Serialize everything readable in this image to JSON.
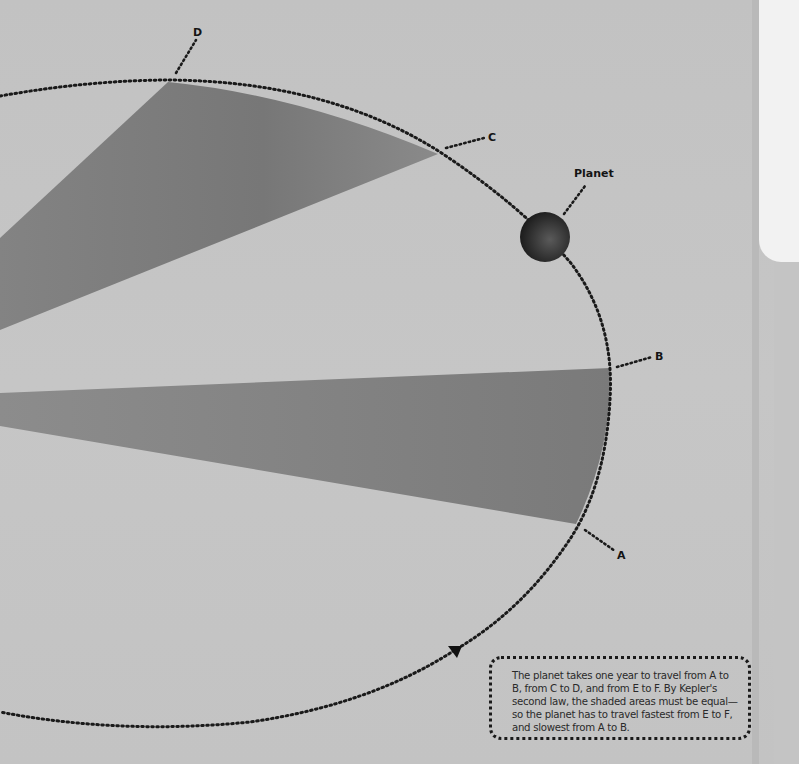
{
  "diagram": {
    "labels": {
      "A": "A",
      "B": "B",
      "C": "C",
      "D": "D",
      "planet": "Planet"
    },
    "caption": "The planet takes one year to travel from A to B, from C to D, and from E to F. By Kepler's second law, the shaded areas must be equal—so the planet has to travel fastest from E to F, and slowest from A to B.",
    "icons": {
      "direction_arrow": "triangle-down-icon",
      "planet": "planet-sphere-icon"
    },
    "colors": {
      "background": "#c4c4c4",
      "shaded_area": "#7a7a7a",
      "orbit_line": "#1a1a1a",
      "planet": "#3a3a3a",
      "panel": "#f2f2f2"
    }
  }
}
